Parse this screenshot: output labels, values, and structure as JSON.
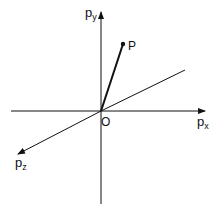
{
  "diagram": {
    "type": "3d-momentum-axes",
    "axes": {
      "x": {
        "label": "p",
        "subscript": "x"
      },
      "y": {
        "label": "p",
        "subscript": "y"
      },
      "z": {
        "label": "p",
        "subscript": "z"
      }
    },
    "origin_label": "O",
    "point_label": "P",
    "colors": {
      "line": "#111111",
      "background": "#ffffff"
    }
  }
}
